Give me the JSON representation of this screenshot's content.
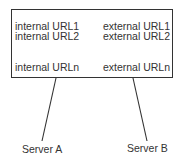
{
  "box": {
    "internal_urls": [
      "internal URL1",
      "internal URL2",
      "internal URLn"
    ],
    "external_urls": [
      "external URL1",
      "external URL2",
      "external URLn"
    ]
  },
  "servers": [
    {
      "label": "Server A"
    },
    {
      "label": "Server B"
    }
  ]
}
